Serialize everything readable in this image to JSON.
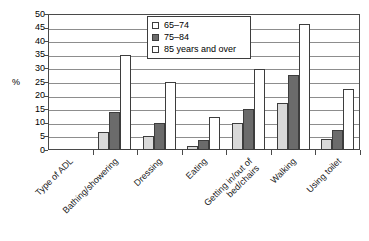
{
  "chart_data": {
    "type": "bar",
    "title": "",
    "xlabel": "Type of ADL",
    "ylabel": "%",
    "ylim": [
      0,
      50
    ],
    "ytick_step": 5,
    "yticks": [
      "50",
      "45",
      "40",
      "35",
      "30",
      "25",
      "20",
      "15",
      "10",
      "5",
      "0"
    ],
    "grid": true,
    "legend_position": "top-center-inside",
    "categories": [
      "Type of ADL",
      "Bathing/showering",
      "Dressing",
      "Eating",
      "Getting in/out of bed/chairs",
      "Walking",
      "Using toilet"
    ],
    "category_lines": [
      [
        "Type of ADL"
      ],
      [
        "Bathing/showering"
      ],
      [
        "Dressing"
      ],
      [
        "Eating"
      ],
      [
        "Getting in/out of",
        "bed/chairs"
      ],
      [
        "Walking"
      ],
      [
        "Using toilet"
      ]
    ],
    "series": [
      {
        "name": "65–74",
        "color": "#d9d9d9",
        "values": [
          null,
          6.8,
          5.3,
          1.6,
          9.8,
          17.4,
          3.9
        ]
      },
      {
        "name": "75–84",
        "color": "#6b6b6b",
        "values": [
          null,
          13.9,
          10.0,
          3.6,
          15.0,
          27.6,
          7.5
        ]
      },
      {
        "name": "85 years and over",
        "color": "#ffffff",
        "values": [
          null,
          35.0,
          25.0,
          12.0,
          29.8,
          46.3,
          22.4
        ]
      }
    ]
  },
  "legend": {
    "items": [
      {
        "label": "65–74"
      },
      {
        "label": "75–84"
      },
      {
        "label": "85 years and over"
      }
    ]
  },
  "colors": {
    "series_65_74": "#d9d9d9",
    "series_75_84": "#6b6b6b",
    "series_85_over": "#ffffff",
    "axis": "#4a4a4a",
    "grid": "#8d8d8d",
    "bar_outline": "#3d3d3d"
  }
}
